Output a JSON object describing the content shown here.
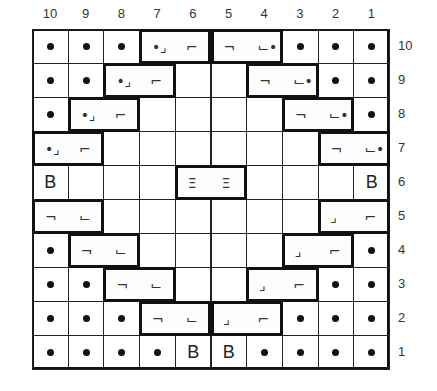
{
  "chart": {
    "column_numbers": [
      "10",
      "9",
      "8",
      "7",
      "6",
      "5",
      "4",
      "3",
      "2",
      "1"
    ],
    "row_numbers": [
      "10",
      "9",
      "8",
      "7",
      "6",
      "5",
      "4",
      "3",
      "2",
      "1"
    ],
    "rows": [
      {
        "row": "10",
        "cells": [
          "dot",
          "dot",
          "dot",
          "cable-left",
          "cable-left",
          "cable-right",
          "cable-right",
          "dot",
          "dot",
          "dot"
        ]
      },
      {
        "row": "9",
        "cells": [
          "dot",
          "dot",
          "cable-left",
          "cable-left",
          "blank",
          "blank",
          "cable-right",
          "cable-right",
          "dot",
          "dot"
        ]
      },
      {
        "row": "8",
        "cells": [
          "dot",
          "cable-left",
          "cable-left",
          "blank",
          "blank",
          "blank",
          "blank",
          "cable-right",
          "cable-right",
          "dot"
        ]
      },
      {
        "row": "7",
        "cells": [
          "cable-left",
          "cable-left",
          "blank",
          "blank",
          "blank",
          "blank",
          "blank",
          "blank",
          "cable-right",
          "cable-right"
        ]
      },
      {
        "row": "6",
        "cells": [
          "B",
          "blank",
          "blank",
          "blank",
          "bar",
          "bar",
          "blank",
          "blank",
          "blank",
          "B"
        ]
      },
      {
        "row": "5",
        "cells": [
          "cable-right",
          "cable-right",
          "blank",
          "blank",
          "blank",
          "blank",
          "blank",
          "blank",
          "cable-left",
          "cable-left"
        ]
      },
      {
        "row": "4",
        "cells": [
          "dot",
          "cable-right",
          "cable-right",
          "blank",
          "blank",
          "blank",
          "blank",
          "cable-left",
          "cable-left",
          "dot"
        ]
      },
      {
        "row": "3",
        "cells": [
          "dot",
          "dot",
          "cable-right",
          "cable-right",
          "blank",
          "blank",
          "cable-left",
          "cable-left",
          "dot",
          "dot"
        ]
      },
      {
        "row": "2",
        "cells": [
          "dot",
          "dot",
          "dot",
          "cable-right",
          "cable-right",
          "cable-left",
          "cable-left",
          "dot",
          "dot",
          "dot"
        ]
      },
      {
        "row": "1",
        "cells": [
          "dot",
          "dot",
          "dot",
          "dot",
          "B",
          "B",
          "dot",
          "dot",
          "dot",
          "dot"
        ]
      }
    ],
    "groups": [
      {
        "row": 10,
        "cols": [
          7,
          6
        ],
        "left": "purl-cross-left",
        "right": "knit-up"
      },
      {
        "row": 10,
        "cols": [
          5,
          4
        ],
        "left": "knit-down",
        "right": "purl-cross-right"
      },
      {
        "row": 9,
        "cols": [
          8,
          7
        ],
        "left": "purl-cross-left",
        "right": "knit-up"
      },
      {
        "row": 9,
        "cols": [
          4,
          3
        ],
        "left": "knit-down",
        "right": "purl-cross-right"
      },
      {
        "row": 8,
        "cols": [
          9,
          8
        ],
        "left": "purl-cross-left",
        "right": "knit-up"
      },
      {
        "row": 8,
        "cols": [
          3,
          2
        ],
        "left": "knit-down",
        "right": "purl-cross-right"
      },
      {
        "row": 7,
        "cols": [
          10,
          9
        ],
        "left": "purl-cross-left",
        "right": "knit-up"
      },
      {
        "row": 7,
        "cols": [
          2,
          1
        ],
        "left": "knit-down",
        "right": "purl-cross-right"
      },
      {
        "row": 6,
        "cols": [
          6,
          5
        ],
        "left": "bar",
        "right": "bar"
      },
      {
        "row": 5,
        "cols": [
          10,
          9
        ],
        "left": "knit-down",
        "right": "knit-down-right"
      },
      {
        "row": 5,
        "cols": [
          2,
          1
        ],
        "left": "knit-up-left",
        "right": "knit-up"
      },
      {
        "row": 4,
        "cols": [
          9,
          8
        ],
        "left": "knit-down",
        "right": "knit-down-right"
      },
      {
        "row": 4,
        "cols": [
          3,
          2
        ],
        "left": "knit-up-left",
        "right": "knit-up"
      },
      {
        "row": 3,
        "cols": [
          8,
          7
        ],
        "left": "knit-down",
        "right": "knit-down-right"
      },
      {
        "row": 3,
        "cols": [
          4,
          3
        ],
        "left": "knit-up-left",
        "right": "knit-up"
      },
      {
        "row": 2,
        "cols": [
          7,
          6
        ],
        "left": "knit-down",
        "right": "knit-down-right"
      },
      {
        "row": 2,
        "cols": [
          5,
          4
        ],
        "left": "knit-up-left",
        "right": "knit-up"
      }
    ],
    "symbols": {
      "B": "B",
      "bar": "Ξ",
      "knit-up": "⌐",
      "knit-down": "¬",
      "knit-down-right": "⌙",
      "knit-up-left": "⌟",
      "purl-cross-left": "•⌟",
      "purl-cross-right": "⌙•"
    }
  }
}
